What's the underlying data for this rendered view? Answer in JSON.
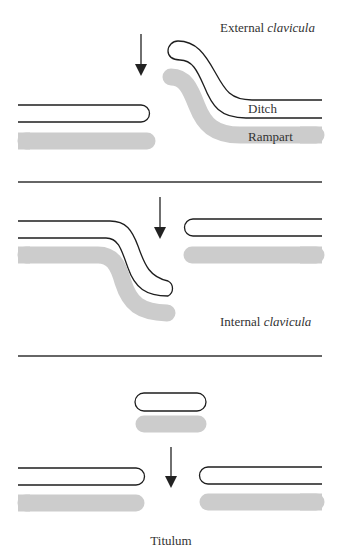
{
  "figure": {
    "sections": [
      {
        "id": "external-clavicula",
        "title_prefix": "External ",
        "title_italic": "clavicula",
        "labels": {
          "ditch": "Ditch",
          "rampart": "Rampart"
        }
      },
      {
        "id": "internal-clavicula",
        "title_prefix": "Internal ",
        "title_italic": "clavicula"
      },
      {
        "id": "titulum",
        "title": "Titulum"
      }
    ],
    "colors": {
      "ditch_outline": "#1e1e1e",
      "rampart_fill": "#cccccc",
      "divider": "#333333",
      "label_text": "#333333"
    }
  }
}
